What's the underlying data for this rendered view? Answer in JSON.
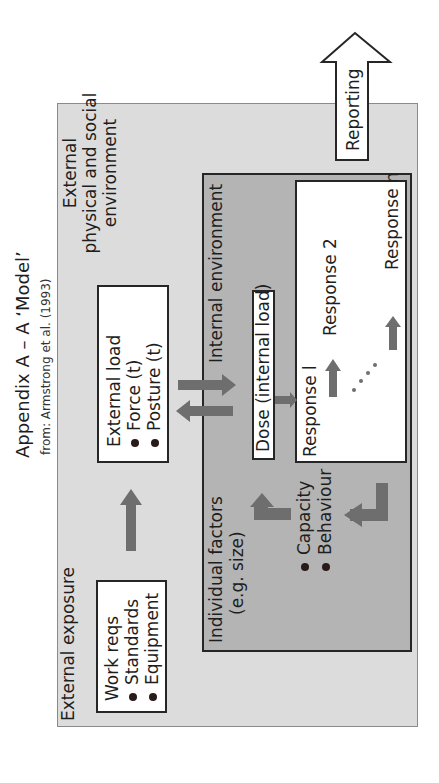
{
  "title": "Appendix A – A ‘Model’",
  "subtitle": "from: Armstrong et al. (1993)",
  "external_environment": {
    "label_line1": "External",
    "label_line2": "physical and social",
    "label_line3": "environment"
  },
  "external_exposure": {
    "label": "External exposure",
    "box": {
      "heading": "Work reqs",
      "items": [
        "Standards",
        "Equipment"
      ]
    }
  },
  "external_load": {
    "heading": "External load",
    "items": [
      "Force (t)",
      "Posture (t)"
    ]
  },
  "internal_environment": {
    "label": "Internal environment",
    "dose_label": "Dose (internal load)"
  },
  "individual_factors": {
    "label_line1": "Individual factors",
    "label_line2": "(e.g. size)",
    "items": [
      "Capacity",
      "Behaviour"
    ]
  },
  "responses": {
    "items": [
      "Response l",
      "Response 2",
      "Response n"
    ],
    "ellipsis": "· · · ·"
  },
  "reporting": {
    "label": "Reporting"
  },
  "colors": {
    "outer_fill": "#dcdcdc",
    "inner_fill": "#b4b4b4",
    "arrow_fill": "#6e6e6e",
    "box_border": "#262626"
  }
}
